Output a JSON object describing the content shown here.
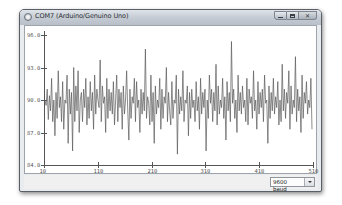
{
  "window": {
    "title": "COM7 (Arduino/Genuino Uno)",
    "controls": {
      "minimize": "minimize",
      "maximize": "maximize",
      "close": "✕"
    }
  },
  "plotter": {
    "y_ticks": [
      "96.0",
      "93.0",
      "90.0",
      "87.0",
      "84.0"
    ],
    "x_ticks": [
      "10",
      "110",
      "210",
      "310",
      "410",
      "510"
    ],
    "line_color": "#5a5a5a"
  },
  "statusbar": {
    "baud_rate": "9600 baud"
  },
  "chart_data": {
    "type": "line",
    "title": "",
    "xlabel": "",
    "ylabel": "",
    "x_ticks": [
      10,
      110,
      210,
      310,
      410,
      510
    ],
    "y_ticks": [
      96.0,
      93.0,
      90.0,
      87.0,
      84.0
    ],
    "xlim": [
      10,
      510
    ],
    "ylim": [
      84.0,
      96.0
    ],
    "grid": false,
    "legend": "none",
    "series": [
      {
        "name": "serial value",
        "description": "Noisy signal oscillating around 90.0, mostly between ~88 and ~92, with occasional spikes up to ~95 and down to ~85",
        "approx_center": 90.0,
        "approx_min": 85.0,
        "approx_max": 95.4,
        "samples": [
          90.0,
          89.5,
          91.0,
          88.2,
          90.4,
          89.0,
          92.0,
          88.0,
          90.0,
          86.7,
          90.7,
          88.3,
          92.7,
          89.3,
          90.3,
          88.0,
          91.7,
          87.3,
          90.0,
          89.7,
          92.3,
          86.0,
          91.0,
          88.7,
          90.7,
          85.3,
          93.0,
          88.0,
          91.3,
          89.0,
          92.7,
          87.0,
          90.0,
          90.7,
          88.0,
          91.0,
          89.3,
          92.0,
          87.7,
          90.3,
          88.3,
          91.7,
          89.0,
          90.7,
          87.3,
          92.3,
          88.7,
          91.0,
          90.0,
          89.3,
          93.7,
          88.0,
          91.3,
          89.7,
          90.3,
          87.0,
          92.0,
          88.3,
          91.0,
          89.0,
          90.7,
          88.7,
          91.7,
          87.7,
          90.0,
          92.3,
          88.0,
          91.0,
          89.3,
          90.7,
          87.3,
          91.3,
          88.7,
          90.0,
          92.7,
          89.0,
          86.3,
          91.0,
          88.3,
          90.3,
          89.7,
          92.0,
          88.0,
          91.7,
          89.3,
          90.0,
          87.0,
          91.0,
          88.7,
          90.7,
          89.0,
          94.7,
          88.3,
          90.3,
          89.7,
          87.7,
          92.3,
          88.0,
          90.7,
          86.0,
          91.3,
          88.7,
          90.0,
          89.3,
          92.0,
          87.3,
          91.0,
          88.3,
          90.3,
          89.7,
          93.0,
          88.0,
          90.7,
          89.0,
          87.7,
          91.7,
          88.3,
          90.0,
          89.7,
          92.3,
          85.0,
          91.0,
          88.7,
          90.3,
          89.0,
          92.7,
          88.0,
          90.0,
          89.7,
          91.3,
          86.7,
          90.7,
          88.3,
          91.0,
          89.3,
          90.0,
          88.0,
          91.7,
          89.0,
          90.3,
          87.3,
          92.0,
          88.7,
          90.7,
          89.3,
          91.0,
          85.3,
          90.0,
          88.3,
          92.3,
          89.7,
          91.0,
          88.0,
          90.7,
          89.0,
          93.3,
          87.7,
          91.3,
          88.7,
          90.0,
          89.3,
          92.0,
          88.3,
          90.3,
          86.3,
          91.7,
          89.0,
          90.7,
          88.0,
          95.4,
          89.7,
          91.0,
          88.3,
          90.0,
          87.0,
          92.3,
          89.0,
          90.7,
          88.7,
          91.3,
          89.3,
          90.0,
          88.0,
          92.0,
          87.7,
          91.0,
          89.7,
          90.3,
          88.3,
          92.7,
          89.0,
          90.0,
          87.3,
          91.7,
          88.7,
          90.7,
          89.3,
          91.0,
          88.0,
          92.3,
          89.7,
          90.0,
          86.0,
          91.3,
          88.3,
          90.7,
          89.0,
          92.0,
          88.7,
          90.3,
          89.3,
          91.7,
          87.7,
          90.0,
          88.0,
          93.3,
          89.0,
          91.0,
          88.3,
          90.7,
          89.7,
          92.7,
          87.3,
          91.3,
          88.7,
          90.0,
          89.3,
          94.0,
          88.0,
          91.0,
          89.0,
          90.3,
          87.0,
          92.3,
          88.3,
          90.7,
          89.7,
          91.7,
          88.7,
          90.0,
          89.3,
          92.0,
          87.3
        ]
      }
    ]
  }
}
